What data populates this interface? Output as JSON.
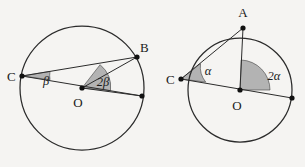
{
  "figure": {
    "background_color": "#f5f4f2",
    "stroke_color": "#2b2b2b",
    "wedge_fill": "#b0b0b0",
    "wedge_stroke": "#3a3a3a"
  },
  "circles": [
    {
      "id": "left-circle",
      "center": {
        "x": 82,
        "y": 88,
        "label": "O"
      },
      "radius": 62,
      "points": [
        {
          "id": "C",
          "label": "C",
          "x": 22,
          "y": 76,
          "label_x": 8,
          "label_y": 81
        },
        {
          "id": "B",
          "label": "B",
          "x": 137,
          "y": 57,
          "label_x": 139,
          "label_y": 52
        },
        {
          "id": "D",
          "label": "",
          "x": 142,
          "y": 96,
          "label_x": 0,
          "label_y": 0
        }
      ],
      "angles": [
        {
          "id": "beta-at-C",
          "label": "β",
          "vertex": "C",
          "label_x": 46,
          "label_y": 83,
          "value": "β"
        },
        {
          "id": "two-beta-at-O",
          "label": "2β",
          "vertex": "O",
          "label_x": 92,
          "label_y": 86,
          "value": "2β"
        }
      ],
      "center_label_x": 78,
      "center_label_y": 106
    },
    {
      "id": "right-circle",
      "center": {
        "x": 240,
        "y": 90,
        "label": "O"
      },
      "radius": 52,
      "points": [
        {
          "id": "A",
          "label": "A",
          "x": 243,
          "y": 28,
          "label_x": 239,
          "label_y": 16
        },
        {
          "id": "C",
          "label": "C",
          "x": 181,
          "y": 79,
          "label_x": 167,
          "label_y": 84
        },
        {
          "id": "D",
          "label": "",
          "x": 292,
          "y": 98,
          "label_x": 0,
          "label_y": 0
        }
      ],
      "angles": [
        {
          "id": "alpha-at-C",
          "label": "α",
          "vertex": "C",
          "label_x": 205,
          "label_y": 73,
          "value": "α"
        },
        {
          "id": "two-alpha-at-O",
          "label": "2α",
          "vertex": "O",
          "label_x": 268,
          "label_y": 79,
          "value": "2α"
        }
      ],
      "center_label_x": 236,
      "center_label_y": 110
    }
  ],
  "labels": {
    "left_C": "C",
    "left_B": "B",
    "left_O": "O",
    "left_beta": "β",
    "left_two_beta": "2β",
    "right_A": "A",
    "right_C": "C",
    "right_O": "O",
    "right_alpha": "α",
    "right_two_alpha": "2α"
  }
}
